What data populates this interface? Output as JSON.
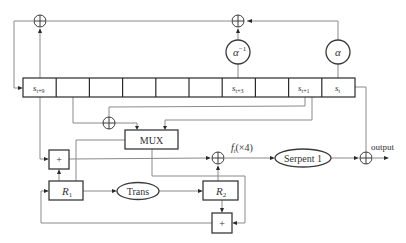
{
  "diagram": {
    "type": "SNOW-like stream cipher structure (LFSR + FSM)",
    "register": {
      "cells": [
        "s_{t+9}",
        "",
        "",
        "",
        "",
        "",
        "s_{t+3}",
        "",
        "s_{t+1}",
        "s_t"
      ],
      "labels": {
        "s_t9": {
          "base": "s",
          "sub": "t+9"
        },
        "s_t3": {
          "base": "s",
          "sub": "t+3"
        },
        "s_t1": {
          "base": "s",
          "sub": "t+1"
        },
        "s_t": {
          "base": "s",
          "sub": "t"
        }
      }
    },
    "multipliers": {
      "alpha_inv": {
        "base": "α",
        "sup": "−1"
      },
      "alpha": {
        "base": "α"
      }
    },
    "boxes": {
      "mux": "MUX",
      "adder_left": "+",
      "adder_bottom": "+",
      "r1": {
        "base": "R",
        "sub": "1"
      },
      "r2": {
        "base": "R",
        "sub": "2"
      }
    },
    "ellipses": {
      "trans": "Trans",
      "serpent": "Serpent 1"
    },
    "labels": {
      "ft": {
        "base": "f",
        "sub": "t",
        "suffix": "(×4)"
      },
      "output": "output"
    },
    "colors": {
      "line": "#8a8a8a",
      "box_stroke": "#3a3a3a",
      "text": "#333333",
      "background": "#ffffff"
    }
  }
}
